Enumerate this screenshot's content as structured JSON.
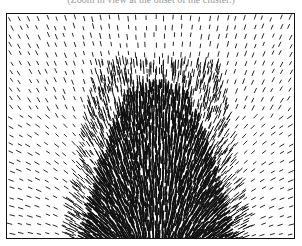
{
  "figure": {
    "caption": "(Zoom in view at the onset of the cluster.)"
  },
  "chart_data": {
    "type": "quiver",
    "title": "(Zoom in view at the onset of the cluster.)",
    "xlabel": "",
    "ylabel": "",
    "grid": false,
    "legend": null,
    "frame": {
      "x": 6,
      "y": 13,
      "width": 289,
      "height": 226
    },
    "cluster": {
      "center_x_frac": 0.52,
      "top_y_frac": 0.4,
      "bottom_halfwidth_frac": 0.27,
      "top_halfwidth_frac": 0.12
    },
    "arrow_color": "#111111",
    "sparse_spacing_px": 9,
    "dense_spacing_px": 3.2,
    "arrow_length_px": 6
  }
}
